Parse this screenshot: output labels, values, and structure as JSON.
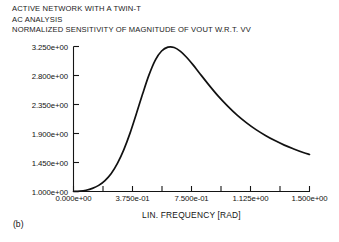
{
  "figure": {
    "caption": "(b)",
    "title_lines": [
      "ACTIVE NETWORK WITH A TWIN-T",
      "AC ANALYSIS",
      "NORMALIZED SENSITIVITY OF MAGNITUDE OF VOUT W.R.T. VV"
    ],
    "line_color": "#111111",
    "axis_color": "#151515",
    "background": "#ffffff"
  },
  "chart_data": {
    "type": "line",
    "title": "NORMALIZED SENSITIVITY OF MAGNITUDE OF VOUT W.R.T. VV",
    "subtitle": "ACTIVE NETWORK WITH A TWIN-T / AC ANALYSIS",
    "xlabel": "LIN. FREQUENCY [RAD]",
    "ylabel": "",
    "xlim": [
      0.0,
      1.5
    ],
    "ylim": [
      1.0,
      3.25
    ],
    "grid": false,
    "legend": null,
    "xticks": [
      0.0,
      0.375,
      0.75,
      1.125,
      1.5
    ],
    "xtick_labels": [
      "0.000e+00",
      "3.750e-01",
      "7.500e-01",
      "1.125e+00",
      "1.500e+00"
    ],
    "x_minor_ticks": [
      0.1875,
      0.5625,
      0.9375,
      1.3125
    ],
    "yticks": [
      1.0,
      1.45,
      1.9,
      2.35,
      2.8,
      3.25
    ],
    "ytick_labels": [
      "1.000e+00",
      "1.450e+00",
      "1.900e+00",
      "2.350e+00",
      "2.800e+00",
      "3.250e+00"
    ],
    "series": [
      {
        "name": "Normalized sensitivity of |VOUT| w.r.t. VV",
        "x": [
          0.0,
          0.04,
          0.08,
          0.12,
          0.16,
          0.2,
          0.24,
          0.28,
          0.32,
          0.36,
          0.4,
          0.44,
          0.48,
          0.52,
          0.56,
          0.6,
          0.64,
          0.68,
          0.72,
          0.76,
          0.8,
          0.86,
          0.92,
          0.98,
          1.04,
          1.1,
          1.16,
          1.22,
          1.28,
          1.34,
          1.4,
          1.46,
          1.5
        ],
        "y": [
          1.0,
          1.005,
          1.02,
          1.048,
          1.095,
          1.17,
          1.28,
          1.44,
          1.65,
          1.91,
          2.21,
          2.52,
          2.81,
          3.04,
          3.18,
          3.24,
          3.235,
          3.175,
          3.08,
          2.965,
          2.84,
          2.655,
          2.48,
          2.325,
          2.185,
          2.065,
          1.96,
          1.87,
          1.79,
          1.72,
          1.66,
          1.605,
          1.575
        ]
      }
    ],
    "peak": {
      "x": 0.605,
      "y": 3.242
    },
    "start_point": {
      "x": 0.0,
      "y": 1.0
    },
    "end_point": {
      "x": 1.5,
      "y": 1.575
    }
  },
  "axis": {
    "x_title": "LIN. FREQUENCY [RAD]"
  }
}
